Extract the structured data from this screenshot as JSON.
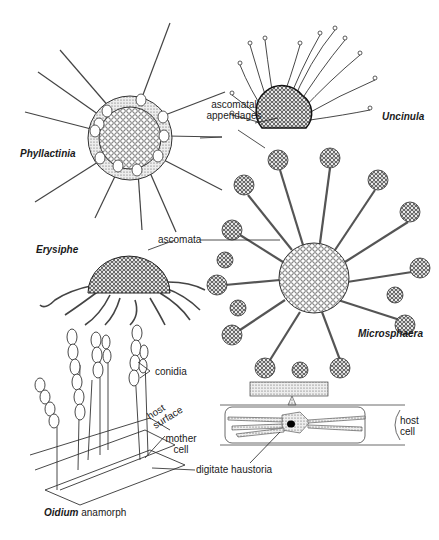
{
  "figure": {
    "organisms": [
      {
        "id": "phyllactinia",
        "label": "Phyllactinia"
      },
      {
        "id": "uncinula",
        "label": "Uncinula"
      },
      {
        "id": "erysiphe",
        "label": "Erysiphe"
      },
      {
        "id": "microsphaera",
        "label": "Microsphaera"
      }
    ],
    "labels": {
      "ascomatal_appendages_1": "ascomatal",
      "ascomatal_appendages_2": "appendages",
      "ascomata": "ascomata",
      "conidia": "conidia",
      "host_surface_1": "host",
      "host_surface_2": "surface",
      "mother_cell_1": "mother",
      "mother_cell_2": "cell",
      "digitate_haustoria": "digitate haustoria",
      "host_cell_1": "host",
      "host_cell_2": "cell"
    },
    "caption": {
      "genus": "Oidium",
      "rest": " anamorph"
    }
  }
}
